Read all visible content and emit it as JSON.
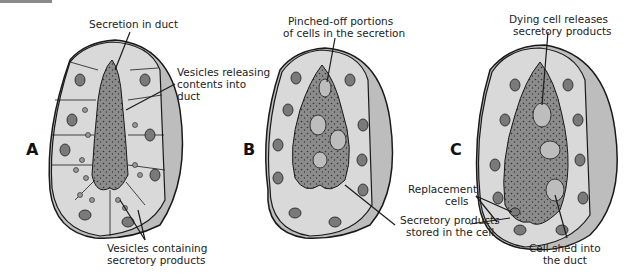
{
  "figure": {
    "panels": [
      {
        "id": "A",
        "letter": "A",
        "labels": {
          "top": "Secretion in duct",
          "right_1": "Vesicles releasing",
          "right_2": "contents into",
          "right_3": "duct",
          "bottom_1": "Vesicles containing",
          "bottom_2": "secretory products"
        }
      },
      {
        "id": "B",
        "letter": "B",
        "labels": {
          "top_1": "Pinched-off portions",
          "top_2": "of cells in the secretion",
          "bottom_1": "Secretory products",
          "bottom_2": "stored in the cell"
        }
      },
      {
        "id": "C",
        "letter": "C",
        "labels": {
          "top_1": "Dying cell releases",
          "top_2": "secretory products",
          "left_1": "Replacement",
          "left_2": "cells",
          "bottom_1": "Cell shed into",
          "bottom_2": "the duct"
        }
      }
    ],
    "colors": {
      "cell_fill": "#d9d9d9",
      "cell_side": "#bdbdbd",
      "duct": "#8c8c8c",
      "nucleus": "#7a7a7a",
      "outline": "#1a1a1a"
    }
  }
}
